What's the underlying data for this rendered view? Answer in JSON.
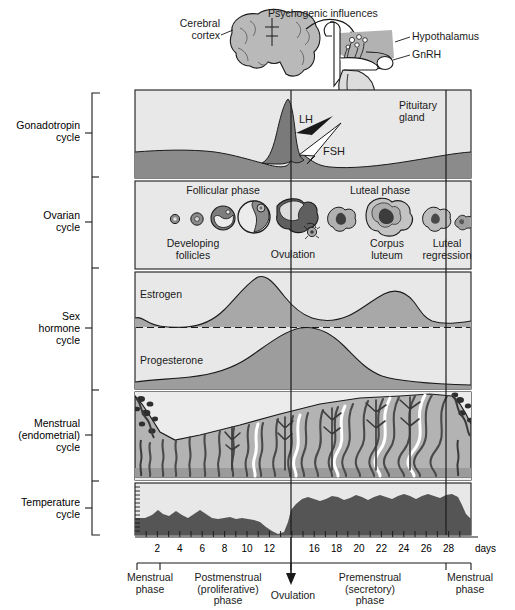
{
  "figure": {
    "anatomy_labels": [
      {
        "name": "cerebral-cortex",
        "text": "Cerebral\ncortex"
      },
      {
        "name": "psychogenic-influences",
        "text": "Psychogenic influences"
      },
      {
        "name": "hypothalamus",
        "text": "Hypothalamus"
      },
      {
        "name": "gnrh",
        "text": "GnRH"
      },
      {
        "name": "pituitary-gland",
        "text": "Pituitary\ngland"
      }
    ],
    "row_labels": [
      {
        "name": "gonadotropin-cycle",
        "text": "Gonadotropin\ncycle"
      },
      {
        "name": "ovarian-cycle",
        "text": "Ovarian\ncycle"
      },
      {
        "name": "sex-hormone-cycle",
        "text": "Sex\nhormone\ncycle"
      },
      {
        "name": "menstrual-endometrial-cycle",
        "text": "Menstrual\n(endometrial)\ncycle"
      },
      {
        "name": "temperature-cycle",
        "text": "Temperature\ncycle"
      }
    ],
    "gonadotropin": {
      "lh_label": "LH",
      "fsh_label": "FSH"
    },
    "ovarian": {
      "follicular_phase": "Follicular phase",
      "luteal_phase": "Luteal phase",
      "developing_follicles": "Developing\nfollicles",
      "ovulation": "Ovulation",
      "corpus_luteum": "Corpus\nluteum",
      "luteal_regression": "Luteal\nregression"
    },
    "hormones": {
      "estrogen": "Estrogen",
      "progesterone": "Progesterone"
    },
    "axis": {
      "tick_labels": [
        "2",
        "4",
        "6",
        "8",
        "10",
        "12",
        "16",
        "18",
        "20",
        "22",
        "24",
        "26",
        "28"
      ],
      "unit_label": "days",
      "tick_days": [
        2,
        4,
        6,
        8,
        10,
        12,
        16,
        18,
        20,
        22,
        24,
        26,
        28
      ],
      "day_min": 0,
      "day_max": 30
    },
    "phases": [
      {
        "name": "menstrual-phase-left",
        "text": "Menstrual\nphase"
      },
      {
        "name": "postmenstrual-phase",
        "text": "Postmenstrual\n(proliferative)\nphase"
      },
      {
        "name": "ovulation-marker",
        "text": "Ovulation"
      },
      {
        "name": "premenstrual-phase",
        "text": "Premenstrual\n(secretory)\nphase"
      },
      {
        "name": "menstrual-phase-right",
        "text": "Menstrual\nphase"
      }
    ],
    "colors": {
      "panel_bg": "#e8e8e8",
      "dark_fill": "#6e6e6e",
      "mid_fill": "#9a9a9a",
      "light_fill": "#c4c4c4",
      "temp_fill": "#595959",
      "stroke": "#1a1a1a"
    }
  },
  "chart_data": {
    "type": "line",
    "xlabel": "days",
    "ylabel": "",
    "xlim": [
      0,
      30
    ],
    "grid": false,
    "legend": "none",
    "series": [
      {
        "name": "LH",
        "panel": "Gonadotropin cycle",
        "x": [
          0,
          2,
          4,
          6,
          8,
          10,
          11,
          12,
          13,
          14,
          15,
          16,
          18,
          20,
          24,
          28,
          30
        ],
        "values": [
          22,
          21,
          20,
          19,
          18,
          20,
          30,
          55,
          88,
          100,
          40,
          22,
          20,
          20,
          21,
          22,
          22
        ]
      },
      {
        "name": "FSH",
        "panel": "Gonadotropin cycle",
        "x": [
          0,
          2,
          4,
          6,
          8,
          10,
          12,
          13,
          14,
          15,
          16,
          18,
          20,
          24,
          28,
          30
        ],
        "values": [
          30,
          29,
          27,
          25,
          23,
          22,
          26,
          42,
          55,
          18,
          14,
          14,
          15,
          17,
          22,
          26
        ]
      },
      {
        "name": "Estrogen",
        "panel": "Sex hormone cycle",
        "x": [
          0,
          2,
          4,
          6,
          8,
          10,
          12,
          13,
          14,
          16,
          18,
          20,
          22,
          24,
          26,
          28,
          30
        ],
        "values": [
          22,
          14,
          12,
          12,
          14,
          28,
          62,
          85,
          95,
          55,
          40,
          38,
          48,
          66,
          70,
          40,
          18
        ]
      },
      {
        "name": "Progesterone",
        "panel": "Sex hormone cycle",
        "x": [
          0,
          2,
          4,
          6,
          8,
          10,
          12,
          14,
          16,
          18,
          20,
          22,
          24,
          26,
          28,
          30
        ],
        "values": [
          8,
          6,
          5,
          5,
          6,
          8,
          14,
          30,
          58,
          82,
          92,
          86,
          66,
          40,
          22,
          12
        ]
      },
      {
        "name": "Basal body temperature",
        "panel": "Temperature cycle",
        "x": [
          0,
          2,
          3,
          4,
          5,
          6,
          7,
          8,
          9,
          10,
          11,
          12,
          13,
          14,
          15,
          16,
          17,
          18,
          19,
          20,
          21,
          22,
          23,
          24,
          25,
          26,
          27,
          28,
          29,
          30
        ],
        "values": [
          30,
          30,
          34,
          38,
          34,
          32,
          37,
          33,
          30,
          34,
          38,
          34,
          30,
          22,
          46,
          62,
          70,
          64,
          70,
          66,
          71,
          65,
          70,
          67,
          72,
          66,
          73,
          68,
          33,
          30
        ]
      },
      {
        "name": "Endometrial thickness",
        "panel": "Menstrual (endometrial) cycle",
        "x": [
          0,
          1,
          2,
          3,
          4,
          5,
          6,
          8,
          10,
          12,
          14,
          16,
          18,
          20,
          22,
          24,
          26,
          27,
          28,
          29,
          30
        ],
        "values": [
          92,
          70,
          40,
          20,
          16,
          18,
          22,
          32,
          42,
          52,
          62,
          70,
          76,
          82,
          86,
          90,
          94,
          96,
          95,
          60,
          30
        ]
      }
    ],
    "ovarian_stages": [
      {
        "day": 2,
        "label": "primordial follicle"
      },
      {
        "day": 4,
        "label": "primary follicle"
      },
      {
        "day": 7,
        "label": "secondary follicle"
      },
      {
        "day": 11,
        "label": "graafian follicle"
      },
      {
        "day": 14,
        "label": "Ovulation"
      },
      {
        "day": 17,
        "label": "early corpus luteum"
      },
      {
        "day": 21,
        "label": "Corpus luteum"
      },
      {
        "day": 25,
        "label": "Luteal regression"
      },
      {
        "day": 28,
        "label": "corpus albicans"
      }
    ],
    "phase_spans": [
      {
        "label": "Menstrual phase",
        "start": 0,
        "end": 2
      },
      {
        "label": "Postmenstrual (proliferative) phase",
        "start": 2,
        "end": 14
      },
      {
        "label": "Premenstrual (secretory) phase",
        "start": 14,
        "end": 26
      },
      {
        "label": "Menstrual phase",
        "start": 26,
        "end": 28
      }
    ],
    "markers": [
      {
        "label": "Ovulation",
        "day": 14
      }
    ]
  }
}
